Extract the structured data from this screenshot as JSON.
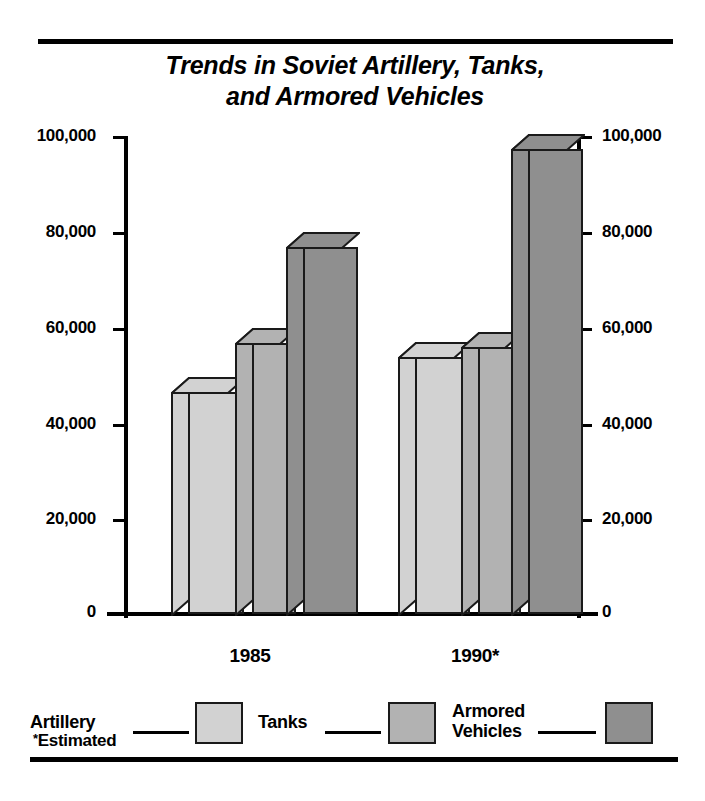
{
  "title": "Trends in Soviet Artillery, Tanks, and Armored Vehicles",
  "title_line1": "Trends in Soviet Artillery, Tanks,",
  "title_line2": "and Armored Vehicles",
  "footnote": "Estimated",
  "footnote_marker": "*",
  "legend": {
    "items": [
      {
        "label": "Artillery",
        "color": "#d2d2d2"
      },
      {
        "label": "Tanks",
        "color": "#b2b2b2"
      },
      {
        "label": "Armored\nVehicles",
        "color": "#8f8f8f"
      }
    ]
  },
  "axis": {
    "ticks": [
      "100,000",
      "80,000",
      "60,000",
      "40,000",
      "20,000",
      "0"
    ]
  },
  "chart_data": {
    "type": "bar",
    "title": "Trends in Soviet Artillery, Tanks, and Armored Vehicles",
    "xlabel": "",
    "ylabel": "",
    "ylim": [
      0,
      100000
    ],
    "yticks": [
      0,
      20000,
      40000,
      60000,
      80000,
      100000
    ],
    "ytick_labels": [
      "0",
      "20,000",
      "40,000",
      "60,000",
      "80,000",
      "100,000"
    ],
    "grid": false,
    "legend_position": "bottom",
    "style": "3d-grouped-bar",
    "categories": [
      "1985",
      "1990*"
    ],
    "series": [
      {
        "name": "Artillery",
        "color": "#d2d2d2",
        "values": [
          46500,
          53500
        ]
      },
      {
        "name": "Tanks",
        "color": "#b2b2b2",
        "values": [
          56000,
          58500
        ]
      },
      {
        "name": "Armored Vehicles",
        "color": "#8f8f8f",
        "values": [
          78000,
          96000
        ]
      }
    ],
    "annotations": [
      "* Estimated"
    ]
  },
  "bars": [
    {
      "name": "artillery-1985",
      "group": "1985",
      "series": "Artillery",
      "value": 46500,
      "left": 188,
      "width": 56,
      "top": 392,
      "color": "#d2d2d2"
    },
    {
      "name": "tanks-1985",
      "group": "1985",
      "series": "Tanks",
      "value": 56000,
      "left": 252,
      "width": 44,
      "top": 343,
      "color": "#b2b2b2"
    },
    {
      "name": "armored-1985",
      "group": "1985",
      "series": "Armored Vehicles",
      "value": 78000,
      "left": 303,
      "width": 55,
      "top": 247,
      "color": "#8f8f8f"
    },
    {
      "name": "artillery-1990",
      "group": "1990*",
      "series": "Artillery",
      "value": 53500,
      "left": 415,
      "width": 55,
      "top": 357,
      "color": "#d2d2d2"
    },
    {
      "name": "tanks-1990",
      "group": "1990*",
      "series": "Tanks",
      "value": 58500,
      "left": 478,
      "width": 43,
      "top": 347,
      "color": "#b2b2b2"
    },
    {
      "name": "armored-1990",
      "group": "1990*",
      "series": "Armored Vehicles",
      "value": 96000,
      "left": 528,
      "width": 55,
      "top": 149,
      "color": "#8f8f8f"
    }
  ]
}
